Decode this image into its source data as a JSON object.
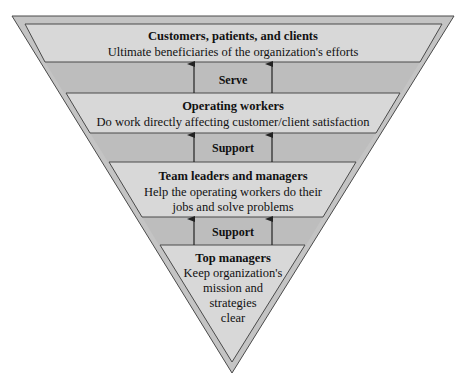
{
  "diagram": {
    "type": "inverted-pyramid",
    "colors": {
      "outer_fill": "#c4c4c4",
      "box_fill": "#d8d8d8",
      "band_fill": "#bdbdbd",
      "stroke": "#4a4a4a",
      "text": "#111111"
    },
    "tiers": [
      {
        "title": "Customers, patients, and clients",
        "lines": [
          "Ultimate beneficiaries of the organization's efforts"
        ]
      },
      {
        "title": "Operating workers",
        "lines": [
          "Do work directly affecting customer/client satisfaction"
        ]
      },
      {
        "title": "Team leaders and managers",
        "lines": [
          "Help the operating workers do their",
          "jobs and solve problems"
        ]
      },
      {
        "title": "Top managers",
        "lines": [
          "Keep organization's",
          "mission and",
          "strategies",
          "clear"
        ]
      }
    ],
    "connectors": [
      {
        "label": "Serve",
        "direction": "up"
      },
      {
        "label": "Support",
        "direction": "up"
      },
      {
        "label": "Support",
        "direction": "up"
      }
    ]
  }
}
